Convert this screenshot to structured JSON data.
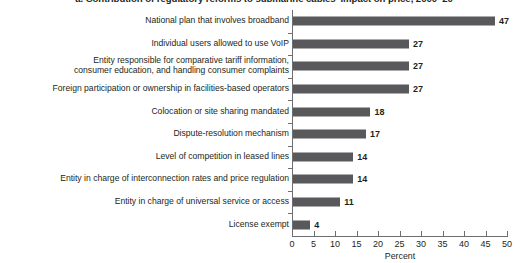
{
  "chart_data": {
    "type": "bar",
    "orientation": "horizontal",
    "title": "a. Contribution of regulatory reforms to submarine cables' impact on price, 2000–20",
    "xlabel": "Percent",
    "ylabel": "",
    "xlim": [
      0,
      50
    ],
    "xticks": [
      0,
      5,
      10,
      15,
      20,
      25,
      30,
      35,
      40,
      45,
      50
    ],
    "grid": false,
    "legend": false,
    "bar_color": "#59595b",
    "categories": [
      "National plan that involves broadband",
      "Individual users allowed to use VoIP",
      "Entity responsible for comparative tariff information,\nconsumer education, and handling consumer complaints",
      "Foreign participation or ownership in facilities-based operators",
      "Colocation or site sharing mandated",
      "Dispute-resolution mechanism",
      "Level of competition in leased lines",
      "Entity in charge of interconnection rates and price regulation",
      "Entity in charge of universal service or access",
      "License exempt"
    ],
    "values": [
      47,
      27,
      27,
      27,
      18,
      17,
      14,
      14,
      11,
      4
    ],
    "value_labels": [
      "47",
      "27",
      "27",
      "27",
      "18",
      "17",
      "14",
      "14",
      "11",
      "4"
    ]
  }
}
